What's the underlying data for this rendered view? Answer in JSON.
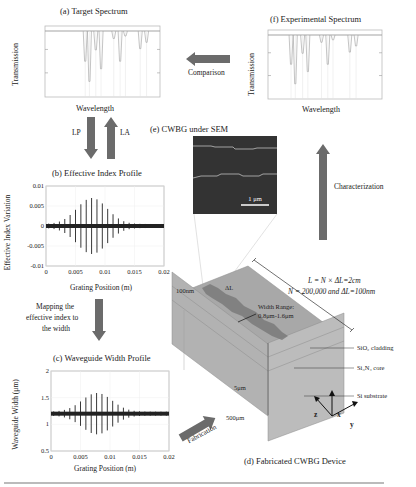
{
  "panels": {
    "a": {
      "title": "(a) Target Spectrum",
      "ylabel": "Transmission",
      "xlabel": "Wavelength",
      "dips": [
        {
          "pos": 0.38,
          "depth": 0.48
        },
        {
          "pos": 0.42,
          "depth": 0.8
        },
        {
          "pos": 0.48,
          "depth": 0.3
        },
        {
          "pos": 0.53,
          "depth": 0.6
        },
        {
          "pos": 0.65,
          "depth": 0.12
        },
        {
          "pos": 0.71,
          "depth": 0.48
        },
        {
          "pos": 0.76,
          "depth": 0.08
        },
        {
          "pos": 0.9,
          "depth": 0.28
        },
        {
          "pos": 0.96,
          "depth": 0.18
        }
      ]
    },
    "f": {
      "title": "(f) Experimental Spectrum",
      "ylabel": "Transmission",
      "xlabel": "Wavelength",
      "dips": [
        {
          "pos": 0.22,
          "depth": 0.48
        },
        {
          "pos": 0.26,
          "depth": 0.8
        },
        {
          "pos": 0.33,
          "depth": 0.3
        },
        {
          "pos": 0.38,
          "depth": 0.6
        },
        {
          "pos": 0.51,
          "depth": 0.12
        },
        {
          "pos": 0.57,
          "depth": 0.48
        },
        {
          "pos": 0.62,
          "depth": 0.08
        },
        {
          "pos": 0.78,
          "depth": 0.28
        },
        {
          "pos": 0.84,
          "depth": 0.18
        }
      ]
    },
    "b": {
      "title": "(b) Effective Index Profile",
      "ylabel": "Effective Index Variation",
      "xlabel": "Grating Position (m)",
      "xticks": [
        "0",
        "0.005",
        "0.01",
        "0.015",
        "0.02"
      ],
      "yticks": [
        "0.01",
        "0.005",
        "0",
        "-0.005",
        "-0.01"
      ]
    },
    "c": {
      "title": "(c) Waveguide Width Profile",
      "ylabel": "Waveguide Width (μm)",
      "xlabel": "Grating Position (m)",
      "xticks": [
        "0",
        "0.005",
        "0.01",
        "0.015",
        "0.02"
      ],
      "yticks": [
        "2",
        "1.5",
        "1",
        "0.5"
      ]
    },
    "e": {
      "title": "(e) CWBG under SEM",
      "scalebar": "1 μm"
    },
    "d": {
      "title": "(d) Fabricated CWBG Device",
      "eq1": "L = N × ΔL=2cm",
      "eq2": "N = 200,000 and ΔL=100nm",
      "label_100nm": "100nm",
      "label_dl": "ΔL",
      "width_range_1": "Width Range:",
      "width_range_2": "0.8μm-1.6μm",
      "sio2": "SiO₂ cladding",
      "si3n4": "Si₃N₄ core",
      "si": "Si substrate",
      "t5": "5μm",
      "t500": "500μm",
      "axes": {
        "z": "z",
        "x": "x",
        "y": "y"
      }
    }
  },
  "arrows": {
    "comparison": "Comparison",
    "lp": "LP",
    "la": "LA",
    "mapping": [
      "Mapping the",
      "effective index to",
      "the width"
    ],
    "characterization": "Characterization",
    "fabrication": "Fabrication"
  },
  "profile": {
    "peak_position_m": 0.0078,
    "b_peak_amplitude": 0.0065,
    "c_center_um": 1.2,
    "c_peak_amplitude_um": 0.35,
    "n_lines": 22
  },
  "colors": {
    "arrow": "#6b6b6b",
    "dip": "#b5b5b5",
    "box_top": "#a9a9a9",
    "box_front": "#bdbdbd",
    "core": "#7a7a7a"
  }
}
